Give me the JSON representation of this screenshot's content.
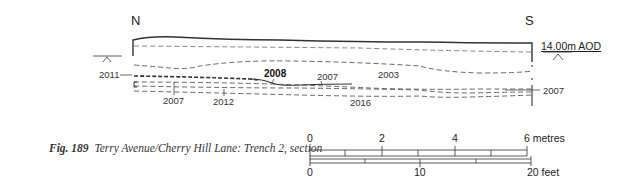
{
  "figure": {
    "number": "Fig. 189",
    "caption": "Terry Avenue/Cherry Hill Lane: Trench 2, section"
  },
  "section": {
    "left_direction": "N",
    "right_direction": "S",
    "datum_label": "14.00m AOD",
    "context_labels": [
      {
        "id": "c2011",
        "text": "2011",
        "bold": false
      },
      {
        "id": "c2007a",
        "text": "2007",
        "bold": false
      },
      {
        "id": "c2012",
        "text": "2012",
        "bold": false
      },
      {
        "id": "c2008",
        "text": "2008",
        "bold": true
      },
      {
        "id": "c2007b",
        "text": "2007",
        "bold": false
      },
      {
        "id": "c2003",
        "text": "2003",
        "bold": false
      },
      {
        "id": "c2016",
        "text": "2016",
        "bold": false
      },
      {
        "id": "c2007c",
        "text": "2007",
        "bold": false
      }
    ]
  },
  "scale_bar": {
    "metres": {
      "ticks": [
        "0",
        "2",
        "4"
      ],
      "end_label": "6 metres"
    },
    "feet": {
      "ticks": [
        "0",
        "10"
      ],
      "end_label": "20 feet"
    }
  },
  "colors": {
    "line": "#333333",
    "dashed": "#555555",
    "background": "#ffffff"
  }
}
